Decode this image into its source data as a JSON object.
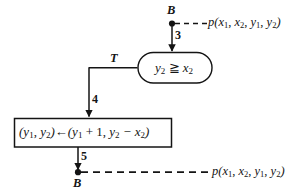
{
  "diagram": {
    "type": "flowchart",
    "background_color": "#ffffff",
    "stroke_color": "#141414",
    "nodes": {
      "entry_terminal": {
        "symbol": "B",
        "predicate": "p(x1, x2, y1, y2)",
        "predicate_parts": {
          "name": "p",
          "open": "(",
          "args": [
            "x",
            "x",
            "y",
            "y"
          ],
          "subs": [
            "1",
            "2",
            "1",
            "2"
          ],
          "sep": ", ",
          "close": ")"
        }
      },
      "decision": {
        "shape": "stadium",
        "left_operand": "y",
        "left_sub": "2",
        "operator": "≧",
        "right_operand": "x",
        "right_sub": "2"
      },
      "assignment": {
        "shape": "rectangle",
        "target_open": "(",
        "target_a": "y",
        "target_a_sub": "1",
        "target_comma": ", ",
        "target_b": "y",
        "target_b_sub": "2",
        "target_close": ")",
        "arrow": "←",
        "value_open": "(",
        "value_a": "y",
        "value_a_sub": "1",
        "value_a_op": " + 1",
        "value_comma": ", ",
        "value_b": "y",
        "value_b_sub": "2",
        "value_b_op": " − x",
        "value_b_op_sub": "2",
        "value_close": ")"
      },
      "exit_terminal": {
        "symbol": "B",
        "predicate": "p(x1, x2, y1, y2)"
      }
    },
    "edges": {
      "entry_to_decision": {
        "number": "3"
      },
      "decision_true_branch": {
        "label": "T",
        "number": "4"
      },
      "assignment_to_exit": {
        "number": "5"
      }
    }
  }
}
